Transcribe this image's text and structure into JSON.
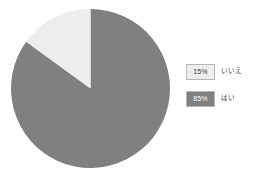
{
  "chart_data": {
    "type": "pie",
    "title": "",
    "subtitle": "",
    "xlabel": "",
    "ylabel": "",
    "grid": false,
    "legend_position": "right",
    "start_angle_deg": 0,
    "direction": "counterclockwise",
    "categories": [
      "いいえ",
      "はい"
    ],
    "values": [
      15,
      85
    ],
    "value_labels": [
      "15%",
      "85%"
    ],
    "colors": [
      "#ededed",
      "#808080"
    ],
    "slices": [
      {
        "label": "いいえ",
        "value": 15,
        "value_label": "15%",
        "color": "#ededed",
        "text_color": "#3d3d3d"
      },
      {
        "label": "はい",
        "value": 85,
        "value_label": "85%",
        "color": "#808080",
        "text_color": "#ffffff"
      }
    ]
  },
  "legend": {
    "items": [
      {
        "value_label": "15%",
        "label": "いいえ"
      },
      {
        "value_label": "85%",
        "label": "はい"
      }
    ]
  },
  "colors": {
    "slice_light": "#ededed",
    "slice_dark": "#808080",
    "swatch_border": "#b6b6b6",
    "text": "#3d3d3d",
    "background": "#ffffff"
  }
}
